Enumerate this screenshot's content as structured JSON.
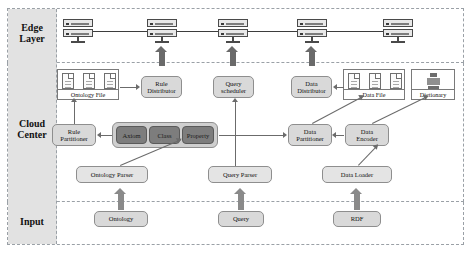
{
  "diagram": {
    "layers": [
      {
        "id": "edge",
        "label": "Edge\nLayer"
      },
      {
        "id": "cloud",
        "label": "Cloud\nCenter"
      },
      {
        "id": "input",
        "label": "Input"
      }
    ],
    "layer_labels": {
      "edge_line1": "Edge",
      "edge_line2": "Layer",
      "cloud_line1": "Cloud",
      "cloud_line2": "Center",
      "input": "Input"
    },
    "edge_nodes": [
      {
        "name": "server-1",
        "label": "server-icon"
      },
      {
        "name": "server-2",
        "label": "server-icon"
      },
      {
        "name": "server-3",
        "label": "server-icon"
      },
      {
        "name": "server-4",
        "label": "server-icon"
      },
      {
        "name": "server-5",
        "label": "server-icon"
      }
    ],
    "cloud_nodes": {
      "ontology_file": "Ontology File",
      "rule_distributor_l1": "Rule",
      "rule_distributor_l2": "Distributor",
      "query_scheduler_l1": "Query",
      "query_scheduler_l2": "scheduler",
      "data_distributor_l1": "Data",
      "data_distributor_l2": "Distributor",
      "data_file": "Data File",
      "dictionary": "Dictionary",
      "rule_partitioner_l1": "Rule",
      "rule_partitioner_l2": "Partitioner",
      "axiom": "Axiom",
      "class": "Class",
      "property": "Property",
      "data_partitioner_l1": "Data",
      "data_partitioner_l2": "Partitioner",
      "data_encoder_l1": "Data",
      "data_encoder_l2": "Encoder",
      "ontology_parser": "Ontology Parser",
      "query_parser": "Query Parser",
      "data_loader": "Data Loader"
    },
    "input_nodes": {
      "ontology": "Ontology",
      "query": "Query",
      "rdf": "RDF"
    },
    "colors": {
      "chip_fill": "#7d7d7d",
      "box_fill": "#d9d9d9",
      "band_border": "#9aa0a6",
      "label_col": "#e2e2e2",
      "connector": "#6b6b6b",
      "fat_arrow": "#8a8a8a"
    }
  }
}
